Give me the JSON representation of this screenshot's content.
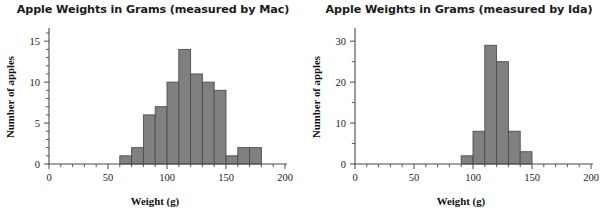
{
  "figure": {
    "panels": [
      {
        "id": "mac",
        "title": "Apple Weights in Grams (measured by Mac)",
        "xlabel": "Weight (g)",
        "ylabel": "Number of apples",
        "xticks": [
          "0",
          "50",
          "100",
          "150",
          "200"
        ],
        "yticks": [
          "0",
          "5",
          "10",
          "15"
        ]
      },
      {
        "id": "ida",
        "title": "Apple Weights in Grams (measured by Ida)",
        "xlabel": "Weight (g)",
        "ylabel": "Number of apples",
        "xticks": [
          "0",
          "50",
          "100",
          "150",
          "200"
        ],
        "yticks": [
          "0",
          "10",
          "20",
          "30"
        ]
      }
    ]
  },
  "chart_data": [
    {
      "type": "bar",
      "subtype": "histogram",
      "title": "Apple Weights in Grams (measured by Mac)",
      "xlabel": "Weight (g)",
      "ylabel": "Number of apples",
      "xlim": [
        0,
        200
      ],
      "ylim": [
        0,
        16
      ],
      "xticks": [
        0,
        50,
        100,
        150,
        200
      ],
      "xticks_minor_step": 10,
      "yticks": [
        0,
        5,
        10,
        15
      ],
      "yticks_minor_step": 1,
      "grid": false,
      "legend": null,
      "bin_width": 10,
      "bin_edges": [
        60,
        70,
        80,
        90,
        100,
        110,
        120,
        130,
        140,
        150,
        160,
        170,
        180
      ],
      "categories": [
        "60-70",
        "70-80",
        "80-90",
        "90-100",
        "100-110",
        "110-120",
        "120-130",
        "130-140",
        "140-150",
        "150-160",
        "160-170",
        "170-180"
      ],
      "values": [
        1,
        2,
        6,
        7,
        10,
        14,
        11,
        10,
        9,
        1,
        2,
        2
      ],
      "bar_color": "#808080",
      "bar_edge_color": "#4d4d4d"
    },
    {
      "type": "bar",
      "subtype": "histogram",
      "title": "Apple Weights in Grams (measured by Ida)",
      "xlabel": "Weight (g)",
      "ylabel": "Number of apples",
      "xlim": [
        0,
        200
      ],
      "ylim": [
        0,
        32
      ],
      "xticks": [
        0,
        50,
        100,
        150,
        200
      ],
      "xticks_minor_step": 10,
      "yticks": [
        0,
        10,
        20,
        30
      ],
      "yticks_minor_step": 5,
      "grid": false,
      "legend": null,
      "bin_width": 10,
      "bin_edges": [
        90,
        100,
        110,
        120,
        130,
        140,
        150
      ],
      "categories": [
        "90-100",
        "100-110",
        "110-120",
        "120-130",
        "130-140",
        "140-150"
      ],
      "values": [
        2,
        8,
        29,
        25,
        8,
        3
      ],
      "bar_color": "#808080",
      "bar_edge_color": "#4d4d4d"
    }
  ]
}
